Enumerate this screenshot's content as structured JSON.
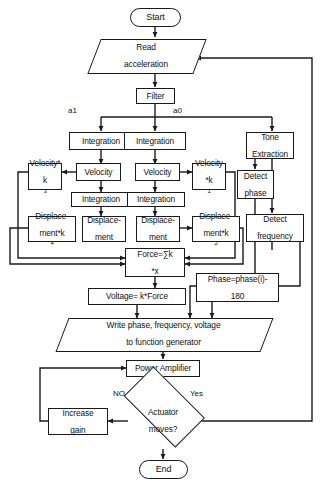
{
  "diagram": {
    "type": "flowchart",
    "orientation": "top-to-bottom",
    "nodes": {
      "start": {
        "label": "Start",
        "shape": "terminator"
      },
      "read_accel": {
        "label": "Read acceleration",
        "shape": "io-parallelogram"
      },
      "filter": {
        "label": "Filter",
        "shape": "process"
      },
      "integration_a1": {
        "label": "Integration",
        "shape": "process"
      },
      "integration_a0": {
        "label": "Integration",
        "shape": "process"
      },
      "tone_extraction": {
        "label": "Tone Extraction",
        "shape": "process"
      },
      "velocity_k3": {
        "label": "Velocity*k3",
        "shape": "process"
      },
      "velocity_left": {
        "label": "Velocity",
        "shape": "process"
      },
      "velocity_right": {
        "label": "Velocity",
        "shape": "process"
      },
      "velocity_k1": {
        "label": "Velocity *k1",
        "shape": "process"
      },
      "detect_phase": {
        "label": "Detect phase",
        "shape": "process"
      },
      "integration_2a": {
        "label": "Integration",
        "shape": "process"
      },
      "integration_2b": {
        "label": "Integration",
        "shape": "process"
      },
      "displacement_k4": {
        "label": "Displace-ment*k4",
        "shape": "process"
      },
      "displacement_l": {
        "label": "Displace-ment",
        "shape": "process"
      },
      "displacement_r": {
        "label": "Displace-ment",
        "shape": "process"
      },
      "displacement_k2": {
        "label": "Displace-ment*k2",
        "shape": "process"
      },
      "detect_frequency": {
        "label": "Detect frequency",
        "shape": "process"
      },
      "force": {
        "label": "Force=∑k *x",
        "shape": "process"
      },
      "voltage": {
        "label": "Voltage= k*Force",
        "shape": "process"
      },
      "phase": {
        "label": "Phase=phase(i)-180",
        "shape": "process"
      },
      "write": {
        "label": "Write phase, frequency, voltage to function generator",
        "shape": "io-parallelogram"
      },
      "power_amplifier": {
        "label": "Power Amplifier",
        "shape": "process"
      },
      "actuator_moves": {
        "label": "Actuator moves?",
        "shape": "decision"
      },
      "increase_gain": {
        "label": "Increase gain",
        "shape": "process"
      },
      "end": {
        "label": "End",
        "shape": "terminator"
      }
    },
    "node_text": {
      "start": "Start",
      "read_accel_line1": "Read",
      "read_accel_line2": "acceleration",
      "filter": "Filter",
      "integration_a1": "Integration",
      "integration_a0": "Integration",
      "tone_line1": "Tone",
      "tone_line2": "Extraction",
      "velocity_k3_line1": "Velocity*",
      "velocity_k3_line2": "k",
      "velocity_k3_sub": "3",
      "velocity_left": "Velocity",
      "velocity_right": "Velocity",
      "velocity_k1_line1": "Velocity",
      "velocity_k1_line2": "*k",
      "velocity_k1_sub": "1",
      "detect_phase_line1": "Detect",
      "detect_phase_line2": "phase",
      "integration_2a": "Integration",
      "integration_2b": "Integration",
      "disp_k4_line1": "Displace-",
      "disp_k4_line2": "ment*k",
      "disp_k4_sub": "4",
      "disp_l_line1": "Displace-",
      "disp_l_line2": "ment",
      "disp_r_line1": "Displace-",
      "disp_r_line2": "ment",
      "disp_k2_line1": "Displace-",
      "disp_k2_line2": "ment*k",
      "disp_k2_sub": "2",
      "detect_freq_line1": "Detect",
      "detect_freq_line2": "frequency",
      "force_line1": "Force=∑k",
      "force_line2": "*x",
      "voltage": "Voltage= k*Force",
      "phase_line1": "Phase=phase(i)-",
      "phase_line2": "180",
      "write_line1": "Write phase, frequency, voltage",
      "write_line2": "to function generator",
      "power_amplifier": "Power Amplifier",
      "actuator_line1": "Actuator",
      "actuator_line2": "moves?",
      "increase_gain_line1": "Increase",
      "increase_gain_line2": "gain",
      "end": "End"
    },
    "edge_labels": {
      "a1": "a1",
      "a0": "a0",
      "no": "NO",
      "yes": "Yes"
    },
    "colors": {
      "stroke": "#1a1a1a",
      "fill": "#ffffff",
      "text": "#111111"
    }
  }
}
